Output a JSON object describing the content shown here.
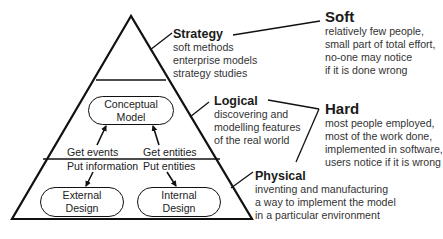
{
  "pyramid": {
    "levels": [
      {
        "title": "Strategy",
        "lines": [
          "soft methods",
          "enterprise models",
          "strategy studies"
        ]
      },
      {
        "title": "Logical",
        "lines": [
          "discovering and",
          "modelling features",
          "of the real world"
        ]
      },
      {
        "title": "Physical",
        "lines": [
          "inventing and manufacturing",
          "a way to implement the model",
          "in a particular environment"
        ]
      }
    ],
    "boxes": {
      "conceptual": [
        "Conceptual",
        "Model"
      ],
      "external": [
        "External",
        "Design"
      ],
      "internal": [
        "Internal",
        "Design"
      ]
    },
    "flows": {
      "get_events": "Get events",
      "get_entities": "Get entities",
      "put_information": "Put information",
      "put_entities": "Put entities"
    }
  },
  "categories": [
    {
      "title": "Soft",
      "lines": [
        "relatively few people,",
        "small part of total effort,",
        "no-one may notice",
        "if it is done wrong"
      ]
    },
    {
      "title": "Hard",
      "lines": [
        "most people employed,",
        "most of the work done,",
        "implemented in software,",
        "users notice if it is wrong"
      ]
    }
  ]
}
